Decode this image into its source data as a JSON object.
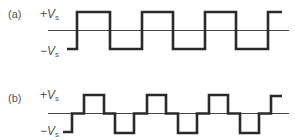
{
  "diagram": {
    "type": "waveform",
    "panels": [
      {
        "id": "a",
        "label": "(a)",
        "pos_label": {
          "sign": "+",
          "var": "V",
          "sub": "s"
        },
        "neg_label": {
          "sign": "−",
          "var": "V",
          "sub": "s"
        },
        "description": "Square wave alternating between +Vs and -Vs",
        "waveform": "square"
      },
      {
        "id": "b",
        "label": "(b)",
        "pos_label": {
          "sign": "+",
          "var": "V",
          "sub": "s"
        },
        "neg_label": {
          "sign": "−",
          "var": "V",
          "sub": "s"
        },
        "description": "Quasi-square wave with zero-level intervals between +Vs and -Vs pulses",
        "waveform": "quasi-square"
      }
    ]
  },
  "colors": {
    "wave": "#2a2a2a",
    "axis": "#444444",
    "label": "#555555",
    "background": "#ffffff"
  }
}
